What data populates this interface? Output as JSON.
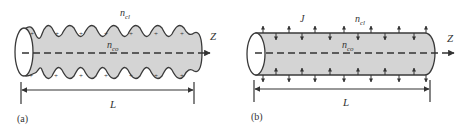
{
  "panels": [
    {
      "id": "a",
      "caption": "(a)",
      "cladding_label": "n",
      "cladding_sub": "cl",
      "core_label": "n",
      "core_sub": "co",
      "axis_label": "Z",
      "length_label": "L",
      "charge_sign": "+"
    },
    {
      "id": "b",
      "caption": "(b)",
      "current_label": "J",
      "cladding_label": "n",
      "cladding_sub": "cl",
      "core_label": "n",
      "core_sub": "co",
      "axis_label": "Z",
      "length_label": "L"
    }
  ],
  "colors": {
    "fill": "#d4d4d4",
    "stroke": "#3a3a3a"
  }
}
